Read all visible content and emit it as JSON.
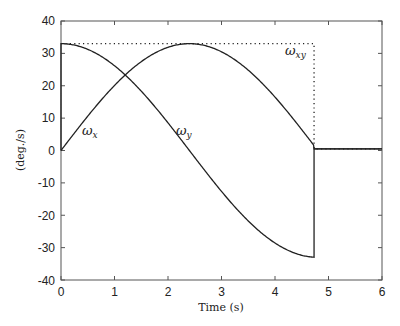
{
  "chart_data": {
    "type": "line",
    "title": "",
    "xlabel": "Time (s)",
    "ylabel": "(deg./s)",
    "xlim": [
      0,
      6
    ],
    "ylim": [
      -40,
      40
    ],
    "xticks": [
      0,
      1,
      2,
      3,
      4,
      5,
      6
    ],
    "yticks": [
      40,
      30,
      20,
      10,
      0,
      -10,
      -20,
      -30,
      -40
    ],
    "grid": false,
    "legend": "none (inline annotations)",
    "switch_time": 4.73,
    "series": [
      {
        "name": "ω_x",
        "style": "solid",
        "x": [
          0,
          0.0,
          0.5,
          1.0,
          1.5,
          2.0,
          2.5,
          3.0,
          3.5,
          4.0,
          4.5,
          4.73,
          4.73,
          6.0
        ],
        "y": [
          0,
          33.0,
          32.4,
          28.9,
          23.2,
          15.8,
          7.2,
          -1.8,
          -10.6,
          -18.8,
          -25.6,
          -32.5,
          0.5,
          0.5
        ],
        "note": "ω_x = 33·cos(ωt), switches to ~0.5 at t≈4.73"
      },
      {
        "name": "ω_y",
        "style": "solid",
        "x": [
          0,
          0.5,
          1.0,
          1.5,
          2.0,
          2.4,
          3.0,
          3.5,
          4.0,
          4.5,
          4.73,
          6.0
        ],
        "y": [
          0,
          11.6,
          21.5,
          28.6,
          32.5,
          33.0,
          31.2,
          25.9,
          18.0,
          8.4,
          0.5,
          0.5
        ],
        "note": "ω_y = 33·sin(ωt)"
      },
      {
        "name": "ω_xy",
        "style": "dotted",
        "x": [
          0,
          4.73,
          4.73,
          6.0
        ],
        "y": [
          33.0,
          33.0,
          0.5,
          0.5
        ]
      }
    ],
    "annotations": [
      {
        "text": "ω_x",
        "x": 0.35,
        "y": 4
      },
      {
        "text": "ω_y",
        "x": 2.15,
        "y": 4
      },
      {
        "text": "ω_xy",
        "x": 4.2,
        "y": 26
      }
    ]
  },
  "labels": {
    "xlabel": "Time (s)",
    "ylabel": "(deg./s)",
    "ann_wx_base": "ω",
    "ann_wx_sub": "x",
    "ann_wy_base": "ω",
    "ann_wy_sub": "y",
    "ann_wxy_base": "ω",
    "ann_wxy_sub": "xy",
    "xt0": "0",
    "xt1": "1",
    "xt2": "2",
    "xt3": "3",
    "xt4": "4",
    "xt5": "5",
    "xt6": "6",
    "yt40": "40",
    "yt30": "30",
    "yt20": "20",
    "yt10": "10",
    "yt0": "0",
    "ytm10": "-10",
    "ytm20": "-20",
    "ytm30": "-30",
    "ytm40": "-40"
  }
}
